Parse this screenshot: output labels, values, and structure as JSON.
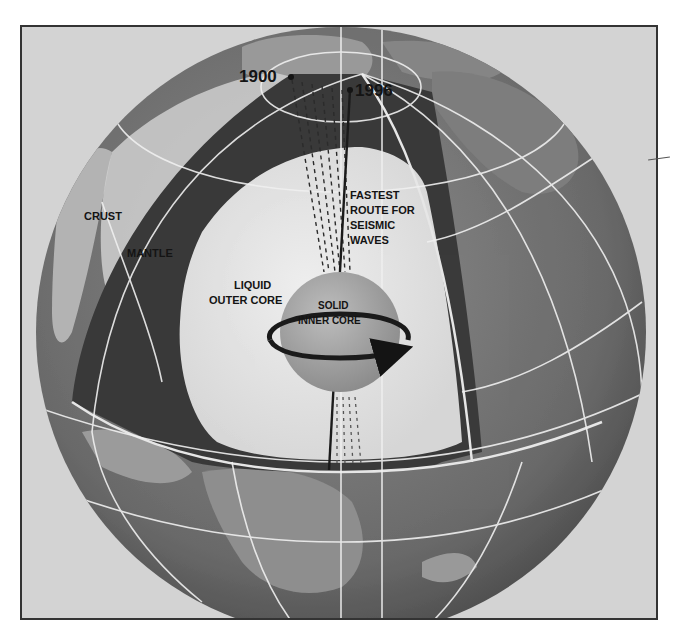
{
  "figure": {
    "type": "earth-cutaway-diagram",
    "colors": {
      "background": "#d3d3d3",
      "frame_border": "#333333",
      "globe_ocean": "#6e6e6e",
      "land": "#8a8a8a",
      "mantle": "#3c3c3c",
      "outer_core": "#e2e2e2",
      "inner_core": "#a6a6a6",
      "grid_lines": "#f0f0f0",
      "label_text": "#141414"
    }
  },
  "labels": {
    "year_1900": "1900",
    "year_1996": "1996",
    "crust": "CRUST",
    "mantle": "MANTLE",
    "outer_core_line1": "LIQUID",
    "outer_core_line2": "OUTER CORE",
    "inner_core_line1": "SOLID",
    "inner_core_line2": "INNER CORE",
    "fastest_route_line1": "FASTEST",
    "fastest_route_line2": "ROUTE FOR",
    "fastest_route_line3": "SEISMIC",
    "fastest_route_line4": "WAVES"
  }
}
